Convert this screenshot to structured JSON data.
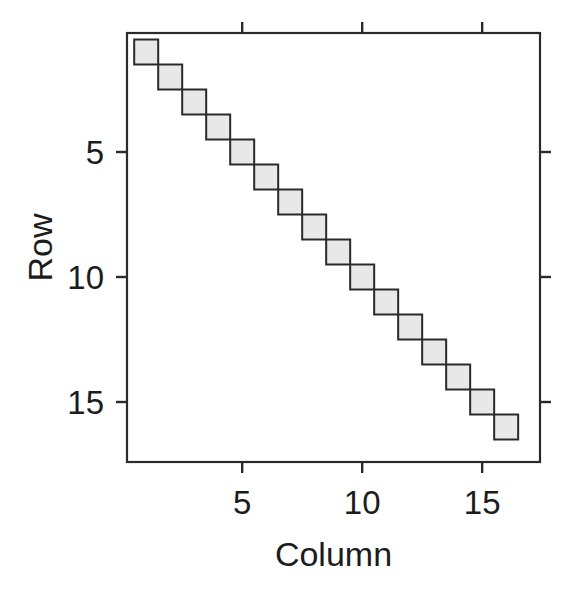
{
  "figure": {
    "background": "#ffffff",
    "frame_color": "#2a2a2a",
    "tick_color": "#2a2a2a",
    "text_color": "#1c1c1c"
  },
  "chart_data": {
    "type": "heatmap",
    "title": "",
    "xlabel": "Column",
    "ylabel": "Row",
    "matrix_rows": 16,
    "matrix_cols": 16,
    "pattern": "identity-diagonal",
    "cells": [
      {
        "row": 1,
        "col": 1,
        "value": 1
      },
      {
        "row": 2,
        "col": 2,
        "value": 1
      },
      {
        "row": 3,
        "col": 3,
        "value": 1
      },
      {
        "row": 4,
        "col": 4,
        "value": 1
      },
      {
        "row": 5,
        "col": 5,
        "value": 1
      },
      {
        "row": 6,
        "col": 6,
        "value": 1
      },
      {
        "row": 7,
        "col": 7,
        "value": 1
      },
      {
        "row": 8,
        "col": 8,
        "value": 1
      },
      {
        "row": 9,
        "col": 9,
        "value": 1
      },
      {
        "row": 10,
        "col": 10,
        "value": 1
      },
      {
        "row": 11,
        "col": 11,
        "value": 1
      },
      {
        "row": 12,
        "col": 12,
        "value": 1
      },
      {
        "row": 13,
        "col": 13,
        "value": 1
      },
      {
        "row": 14,
        "col": 14,
        "value": 1
      },
      {
        "row": 15,
        "col": 15,
        "value": 1
      },
      {
        "row": 16,
        "col": 16,
        "value": 1
      }
    ],
    "cell_fill": "#e8e8e8",
    "cell_border": "#2a2a2a",
    "x_ticks": [
      5,
      10,
      15
    ],
    "y_ticks": [
      5,
      10,
      15
    ],
    "x_range": [
      0.2,
      17.41
    ],
    "y_range": [
      0.24,
      17.4
    ],
    "y_axis_reversed": true,
    "ticks_on_all_sides": true,
    "grid": false,
    "legend": false
  }
}
